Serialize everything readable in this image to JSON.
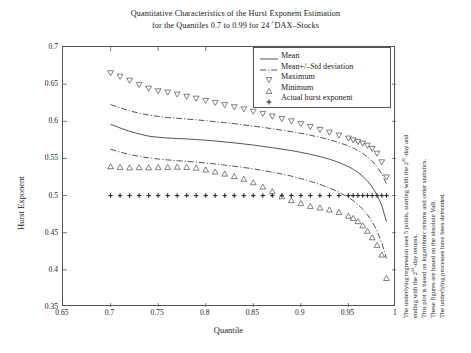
{
  "title": {
    "line1": "Quantitative Characteristics of the Hurst Exponent Estimation",
    "line2": "for the Quantiles 0.7 to 0.99 for 24 `DAX–Stocks"
  },
  "axes": {
    "xlabel": "Quantile",
    "ylabel": "Hurst Exponent",
    "xticks": [
      "0.65",
      "0.7",
      "0.75",
      "0.8",
      "0.85",
      "0.9",
      "0.95",
      "1"
    ],
    "yticks": [
      "0.35",
      "0.4",
      "0.45",
      "0.5",
      "0.55",
      "0.6",
      "0.65",
      "0.7"
    ],
    "xlim": [
      0.65,
      1.0
    ],
    "ylim": [
      0.35,
      0.7
    ]
  },
  "legend": {
    "position": "top-right",
    "items": [
      {
        "label": "Mean",
        "marker": "solid-line"
      },
      {
        "label": "Mean+/–Std deviation",
        "marker": "dashdot-line"
      },
      {
        "label": "Maximum",
        "marker": "triangle-down"
      },
      {
        "label": "Minimum",
        "marker": "triangle-up"
      },
      {
        "label": "Actual hurst exponent",
        "marker": "plus"
      }
    ]
  },
  "side_notes": [
    "The underlying regression uses 5 points, starting with the 2²⁰-day and",
    "ending with the 2²⁴-day returns.",
    "This plot is based on logarithmic returns and order statistics.",
    "These figures are based on the absolute VaR.",
    "The underlying processes have been detrended."
  ],
  "chart_data": {
    "type": "line",
    "title": "Quantitative Characteristics of the Hurst Exponent Estimation for the Quantiles 0.7 to 0.99 for 24 `DAX–Stocks",
    "xlabel": "Quantile",
    "ylabel": "Hurst Exponent",
    "xlim": [
      0.65,
      1.0
    ],
    "ylim": [
      0.35,
      0.7
    ],
    "grid": false,
    "legend_position": "top-right",
    "x": [
      0.7,
      0.71,
      0.72,
      0.73,
      0.74,
      0.75,
      0.76,
      0.77,
      0.78,
      0.79,
      0.8,
      0.81,
      0.82,
      0.83,
      0.84,
      0.85,
      0.86,
      0.87,
      0.88,
      0.89,
      0.9,
      0.91,
      0.92,
      0.93,
      0.94,
      0.95,
      0.955,
      0.96,
      0.965,
      0.97,
      0.975,
      0.98,
      0.985,
      0.99
    ],
    "series": [
      {
        "name": "Mean",
        "style": "solid-line",
        "values": [
          0.596,
          0.591,
          0.5865,
          0.583,
          0.58,
          0.5785,
          0.5775,
          0.5768,
          0.5762,
          0.5755,
          0.5745,
          0.5735,
          0.5722,
          0.571,
          0.5695,
          0.568,
          0.5662,
          0.5645,
          0.5625,
          0.5605,
          0.5582,
          0.5555,
          0.5525,
          0.549,
          0.5445,
          0.539,
          0.5355,
          0.531,
          0.526,
          0.5195,
          0.5115,
          0.501,
          0.487,
          0.465
        ]
      },
      {
        "name": "Mean+Std deviation",
        "style": "dashdot-line",
        "values": [
          0.6225,
          0.618,
          0.614,
          0.611,
          0.6085,
          0.6065,
          0.605,
          0.604,
          0.603,
          0.602,
          0.6008,
          0.5995,
          0.5982,
          0.5968,
          0.5952,
          0.5935,
          0.5918,
          0.59,
          0.588,
          0.586,
          0.5838,
          0.5812,
          0.5785,
          0.5752,
          0.5715,
          0.5668,
          0.564,
          0.5605,
          0.5568,
          0.552,
          0.5462,
          0.539,
          0.5292,
          0.5155
        ]
      },
      {
        "name": "Mean–Std deviation",
        "style": "dashdot-line",
        "values": [
          0.5625,
          0.5585,
          0.5552,
          0.5528,
          0.5508,
          0.5492,
          0.548,
          0.547,
          0.546,
          0.545,
          0.5438,
          0.5425,
          0.541,
          0.5395,
          0.5378,
          0.536,
          0.5338,
          0.5315,
          0.529,
          0.5262,
          0.523,
          0.5192,
          0.515,
          0.5102,
          0.5045,
          0.4975,
          0.4932,
          0.488,
          0.4818,
          0.4742,
          0.4648,
          0.4528,
          0.4368,
          0.415
        ]
      },
      {
        "name": "Maximum",
        "style": "triangle-down-markers",
        "values": [
          0.6648,
          0.66,
          0.6548,
          0.649,
          0.644,
          0.6405,
          0.6388,
          0.636,
          0.633,
          0.6305,
          0.6275,
          0.6248,
          0.6218,
          0.619,
          0.6162,
          0.613,
          0.61,
          0.6065,
          0.6032,
          0.6,
          0.5962,
          0.5925,
          0.5885,
          0.5848,
          0.5808,
          0.5768,
          0.5745,
          0.5722,
          0.57,
          0.5672,
          0.5628,
          0.5565,
          0.5448,
          0.5245
        ]
      },
      {
        "name": "Minimum",
        "style": "triangle-up-markers",
        "values": [
          0.5395,
          0.5385,
          0.5378,
          0.5382,
          0.538,
          0.5382,
          0.5385,
          0.5388,
          0.5385,
          0.5375,
          0.535,
          0.5322,
          0.5295,
          0.5262,
          0.5225,
          0.5178,
          0.512,
          0.5058,
          0.499,
          0.4938,
          0.4898,
          0.486,
          0.4838,
          0.4812,
          0.4778,
          0.4728,
          0.4698,
          0.4655,
          0.4598,
          0.4525,
          0.4438,
          0.4335,
          0.4205,
          0.389
        ]
      },
      {
        "name": "Actual hurst exponent",
        "style": "plus-markers",
        "values": [
          0.5,
          0.5,
          0.5,
          0.5,
          0.5,
          0.5,
          0.5,
          0.5,
          0.5,
          0.5,
          0.5,
          0.5,
          0.5,
          0.5,
          0.5,
          0.5,
          0.5,
          0.5,
          0.5,
          0.5,
          0.5,
          0.5,
          0.5,
          0.5,
          0.5,
          0.5,
          0.5,
          0.5,
          0.5,
          0.5,
          0.5,
          0.5,
          0.5,
          0.5
        ]
      }
    ]
  }
}
